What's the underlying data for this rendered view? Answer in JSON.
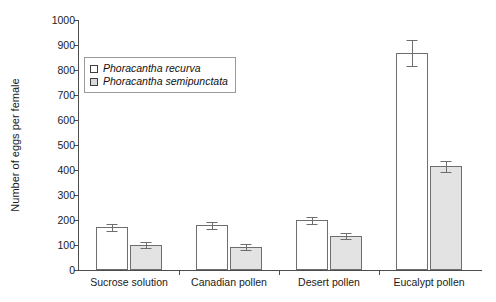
{
  "chart_data": {
    "type": "bar",
    "title": "",
    "xlabel": "",
    "ylabel": "Number of eggs per female",
    "ylim": [
      0,
      1000
    ],
    "ytick_step": 100,
    "yticks": [
      1000,
      900,
      800,
      700,
      600,
      500,
      400,
      300,
      200,
      100,
      0
    ],
    "ytick_labels": [
      "1000",
      "900",
      "800",
      "700",
      "600",
      "500",
      "400",
      "300",
      "200",
      "100",
      "0"
    ],
    "grid": false,
    "legend_position": "upper-left-inside",
    "categories": [
      "Sucrose solution",
      "Canadian pollen",
      "Desert pollen",
      "Eucalypt pollen"
    ],
    "series": [
      {
        "name": "Phoracantha recurva",
        "fill": "#ffffff",
        "values": [
          172,
          180,
          200,
          870
        ],
        "errors": [
          14,
          14,
          14,
          52
        ]
      },
      {
        "name": "Phoracantha semipunctata",
        "fill": "#e3e3e3",
        "values": [
          100,
          92,
          135,
          415
        ],
        "errors": [
          12,
          12,
          12,
          22
        ]
      }
    ]
  },
  "legend": {
    "items": [
      {
        "label": "Phoracantha recurva",
        "swatch": "recurva"
      },
      {
        "label": "Phoracantha semipunctata",
        "swatch": "semipunctata"
      }
    ]
  },
  "colors": {
    "axis": "#4d4d4d",
    "bar_border": "#6e6e6e",
    "recurva_fill": "#ffffff",
    "semipunctata_fill": "#e3e3e3",
    "text": "#1a1a1a"
  }
}
